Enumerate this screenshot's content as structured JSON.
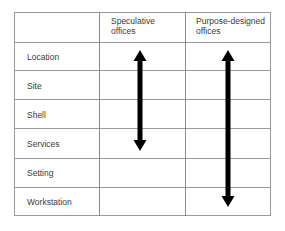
{
  "table": {
    "columns": [
      "",
      "Speculative offices",
      "Purpose-designed offices"
    ],
    "header": {
      "col1_line1": "Speculative",
      "col1_line2": "offices",
      "col2_line1": "Purpose-designed",
      "col2_line2": "offices"
    },
    "rows": [
      "Location",
      "Site",
      "Shell",
      "Services",
      "Setting",
      "Workstation"
    ]
  },
  "arrows": [
    {
      "column": "Speculative offices",
      "from": "Location",
      "to": "Services",
      "direction": "bidirectional"
    },
    {
      "column": "Purpose-designed offices",
      "from": "Location",
      "to": "Workstation",
      "direction": "bidirectional"
    }
  ],
  "colors": {
    "grid": "#9a9a9a",
    "arrow": "#000000",
    "text": "#3a3a3a"
  }
}
